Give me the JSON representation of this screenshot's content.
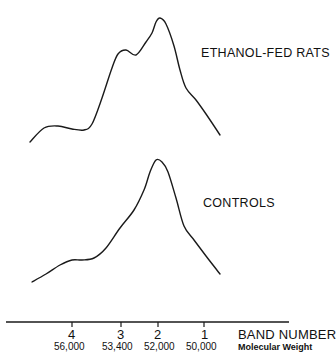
{
  "chart_data": {
    "type": "line",
    "title": "",
    "xlabel": "BAND NUMBER",
    "xlabel_secondary": "Molecular Weight",
    "ylabel": "",
    "grid": false,
    "legend": "inline labels to the right of each trace",
    "x_ticks": [
      {
        "band": "4",
        "mw": "56,000"
      },
      {
        "band": "3",
        "mw": "53,400"
      },
      {
        "band": "2",
        "mw": "52,000"
      },
      {
        "band": "1",
        "mw": "50,000"
      }
    ],
    "series": [
      {
        "name": "ETHANOL-FED RATS",
        "description": "densitometric trace with shoulder at band 3 and main peak at band 2",
        "points": [
          [
            30,
            142
          ],
          [
            44,
            128
          ],
          [
            58,
            126
          ],
          [
            72,
            129
          ],
          [
            84,
            130
          ],
          [
            92,
            124
          ],
          [
            102,
            98
          ],
          [
            112,
            68
          ],
          [
            118,
            54
          ],
          [
            126,
            50
          ],
          [
            136,
            55
          ],
          [
            146,
            42
          ],
          [
            152,
            33
          ],
          [
            156,
            22
          ],
          [
            160,
            18
          ],
          [
            166,
            24
          ],
          [
            174,
            46
          ],
          [
            180,
            70
          ],
          [
            186,
            88
          ],
          [
            196,
            100
          ],
          [
            206,
            114
          ],
          [
            220,
            135
          ]
        ]
      },
      {
        "name": "CONTROLS",
        "description": "densitometric trace with single main peak at band 2",
        "points": [
          [
            32,
            282
          ],
          [
            46,
            274
          ],
          [
            60,
            265
          ],
          [
            72,
            260
          ],
          [
            82,
            260
          ],
          [
            94,
            258
          ],
          [
            106,
            248
          ],
          [
            120,
            228
          ],
          [
            134,
            210
          ],
          [
            144,
            190
          ],
          [
            150,
            172
          ],
          [
            156,
            160
          ],
          [
            162,
            162
          ],
          [
            168,
            172
          ],
          [
            176,
            198
          ],
          [
            184,
            226
          ],
          [
            194,
            240
          ],
          [
            206,
            256
          ],
          [
            220,
            274
          ]
        ]
      }
    ]
  },
  "labels": {
    "ethanol": "ETHANOL-FED RATS",
    "controls": "CONTROLS",
    "axis_title": "BAND NUMBER",
    "axis_sub": "Molecular Weight",
    "bands": [
      "4",
      "3",
      "2",
      "1"
    ],
    "mw": [
      "56,000",
      "53,400",
      "52,000",
      "50,000"
    ]
  }
}
